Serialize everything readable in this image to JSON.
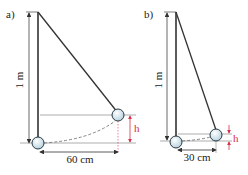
{
  "panels": [
    {
      "label": "a)",
      "length_label": "1 m",
      "horizontal_label": "60 cm",
      "height_label": "h"
    },
    {
      "label": "b)",
      "length_label": "1 m",
      "horizontal_label": "30 cm",
      "height_label": "h"
    }
  ],
  "colors": {
    "string": "#333333",
    "dimension": "#444444",
    "height_marker": "#d6304a",
    "ball_fill": "#dbeaf2",
    "ball_stroke": "#2a3a44"
  }
}
